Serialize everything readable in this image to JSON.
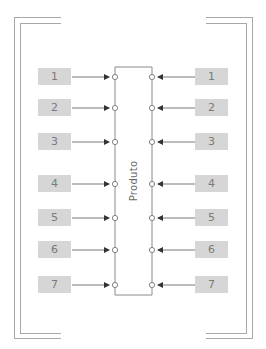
{
  "diagram": {
    "center_label": "Produto",
    "colors": {
      "frame": "#a8a8a8",
      "label_fill": "#d6d6d6",
      "label_text": "#7a7a7a",
      "arrow": "#333333",
      "product_outline": "#8a8a8a"
    },
    "left_inputs": [
      {
        "label": "1"
      },
      {
        "label": "2"
      },
      {
        "label": "3"
      },
      {
        "label": "4"
      },
      {
        "label": "5"
      },
      {
        "label": "6"
      },
      {
        "label": "7"
      }
    ],
    "right_inputs": [
      {
        "label": "1"
      },
      {
        "label": "2"
      },
      {
        "label": "3"
      },
      {
        "label": "4"
      },
      {
        "label": "5"
      },
      {
        "label": "6"
      },
      {
        "label": "7"
      }
    ]
  }
}
